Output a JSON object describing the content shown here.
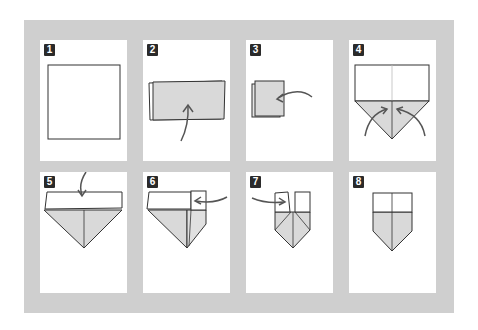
{
  "colors": {
    "frame": "#cfcfcf",
    "panel": "#ffffff",
    "paper_back": "#d9d9d9",
    "line": "#333333",
    "badge": "#2a2a2a"
  },
  "steps": [
    {
      "number": "1",
      "description": "square sheet"
    },
    {
      "number": "2",
      "description": "fold bottom up"
    },
    {
      "number": "3",
      "description": "fold right to left"
    },
    {
      "number": "4",
      "description": "fold bottom corners up to center"
    },
    {
      "number": "5",
      "description": "fold top flap down"
    },
    {
      "number": "6",
      "description": "fold right side in"
    },
    {
      "number": "7",
      "description": "fold left side in"
    },
    {
      "number": "8",
      "description": "finished shape"
    }
  ]
}
